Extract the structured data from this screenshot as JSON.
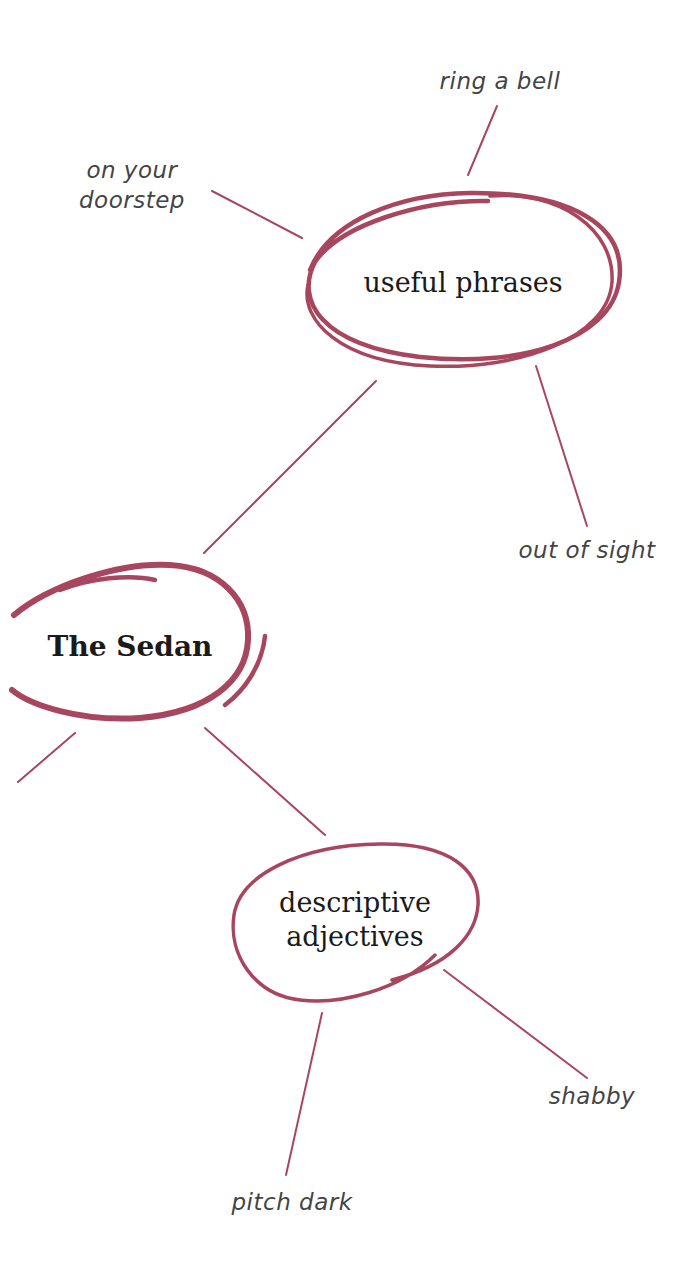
{
  "colors": {
    "stroke": "#a8465f",
    "text": "#1a1a1a",
    "leaf_text": "#444444",
    "background": "#ffffff"
  },
  "central": {
    "label": "The Sedan"
  },
  "branches": [
    {
      "label": "useful phrases",
      "leaves": [
        "ring a bell",
        "on your doorstep",
        "out of sight"
      ]
    },
    {
      "label_line1": "descriptive",
      "label_line2": "adjectives",
      "leaves": [
        "shabby",
        "pitch dark"
      ]
    }
  ],
  "leaves": {
    "ring_a_bell": "ring a bell",
    "on_your": "on your",
    "doorstep": "doorstep",
    "out_of_sight": "out of sight",
    "shabby": "shabby",
    "pitch_dark": "pitch dark"
  }
}
